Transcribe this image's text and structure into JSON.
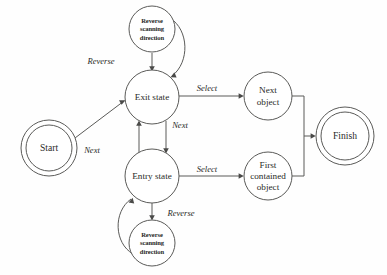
{
  "diagram": {
    "type": "state-machine-diagram",
    "canvas": {
      "width": 387,
      "height": 275,
      "background": "#fefefe"
    },
    "stroke_color": "#5a5a58",
    "text_color": "#2a2a28",
    "nodes": [
      {
        "id": "start",
        "shape": "double-circle",
        "kind": "terminal",
        "cx": 49,
        "cy": 148,
        "r": 28,
        "inner_r": 23,
        "lines": [
          "Start"
        ]
      },
      {
        "id": "exit-state",
        "shape": "circle",
        "kind": "state",
        "cx": 152,
        "cy": 97,
        "r": 27,
        "lines": [
          "Exit state"
        ]
      },
      {
        "id": "entry-state",
        "shape": "circle",
        "kind": "state",
        "cx": 152,
        "cy": 176,
        "r": 27,
        "lines": [
          "Entry state"
        ]
      },
      {
        "id": "reverse-scanning-top",
        "shape": "circle",
        "kind": "action",
        "cx": 152,
        "cy": 29,
        "r": 23,
        "lines": [
          "Reverse",
          "scanning",
          "direction"
        ]
      },
      {
        "id": "reverse-scanning-bottom",
        "shape": "circle",
        "kind": "action",
        "cx": 152,
        "cy": 243,
        "r": 23,
        "lines": [
          "Reverse",
          "scanning",
          "direction"
        ]
      },
      {
        "id": "next-object",
        "shape": "circle",
        "kind": "object",
        "cx": 268,
        "cy": 96,
        "r": 24,
        "lines": [
          "Next",
          "object"
        ]
      },
      {
        "id": "first-contained-object",
        "shape": "circle",
        "kind": "object",
        "cx": 268,
        "cy": 176,
        "r": 24,
        "lines": [
          "First",
          "contained",
          "object"
        ]
      },
      {
        "id": "finish",
        "shape": "double-circle",
        "kind": "terminal",
        "cx": 345,
        "cy": 136,
        "r": 29,
        "inner_r": 24,
        "lines": [
          "Finish"
        ]
      }
    ],
    "edges": [
      {
        "id": "start-to-exit",
        "from": "start",
        "to": "exit-state",
        "label": "Next",
        "label_x": 92,
        "label_y": 151
      },
      {
        "id": "exit-to-reverse",
        "from": "exit-state",
        "to": "reverse-scanning-top",
        "label": "Reverse",
        "label_x": 101,
        "label_y": 62
      },
      {
        "id": "reverse-top-back-to-exit",
        "from": "reverse-scanning-top",
        "to": "exit-state",
        "label": "",
        "label_x": 0,
        "label_y": 0
      },
      {
        "id": "entry-to-exit",
        "from": "entry-state",
        "to": "exit-state",
        "label": "Next",
        "label_x": 108,
        "label_y": 148
      },
      {
        "id": "exit-to-entry",
        "from": "exit-state",
        "to": "entry-state",
        "label": "Next",
        "label_x": 180,
        "label_y": 126
      },
      {
        "id": "entry-to-reverse",
        "from": "entry-state",
        "to": "reverse-scanning-bottom",
        "label": "Reverse",
        "label_x": 181,
        "label_y": 214
      },
      {
        "id": "reverse-bottom-back-to-entry",
        "from": "reverse-scanning-bottom",
        "to": "entry-state",
        "label": "",
        "label_x": 0,
        "label_y": 0
      },
      {
        "id": "exit-to-next-object",
        "from": "exit-state",
        "to": "next-object",
        "label": "Select",
        "label_x": 207,
        "label_y": 89
      },
      {
        "id": "entry-to-first-contained",
        "from": "entry-state",
        "to": "first-contained-object",
        "label": "Select",
        "label_x": 207,
        "label_y": 170
      },
      {
        "id": "next-object-to-finish",
        "from": "next-object",
        "to": "finish",
        "label": "",
        "label_x": 0,
        "label_y": 0
      },
      {
        "id": "first-contained-to-finish",
        "from": "first-contained-object",
        "to": "finish",
        "label": "",
        "label_x": 0,
        "label_y": 0
      }
    ]
  }
}
